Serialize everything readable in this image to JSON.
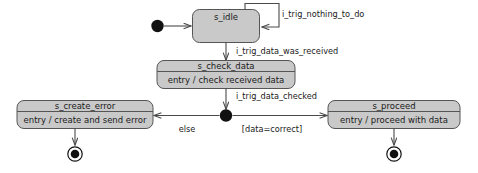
{
  "diagram": {
    "type": "uml-state-machine",
    "title": "",
    "colors": {
      "state_fill": "#c9c9c9",
      "state_stroke": "#555555",
      "transition_stroke": "#4a4a4a",
      "pseudostate_fill": "#111111",
      "background": "#ffffff",
      "text": "#1a1a1a"
    }
  },
  "states": {
    "idle": {
      "name": "s_idle",
      "body": ""
    },
    "check_data": {
      "name": "s_check_data",
      "body": "entry / check received data"
    },
    "create_error": {
      "name": "s_create_error",
      "body": "entry / create and send error"
    },
    "proceed": {
      "name": "s_proceed",
      "body": "entry / proceed with data"
    }
  },
  "pseudostates": {
    "initial": "initial-state",
    "junction": "junction-point",
    "final_left": "final-state",
    "final_right": "final-state"
  },
  "transitions": {
    "initial_to_idle": "",
    "idle_self_loop": "i_trig_nothing_to_do",
    "idle_to_check": "i_trig_data_was_received",
    "check_to_junction": "i_trig_data_checked",
    "junction_to_error": "else",
    "junction_to_proceed": "[data=correct]",
    "error_to_final": "",
    "proceed_to_final": ""
  }
}
